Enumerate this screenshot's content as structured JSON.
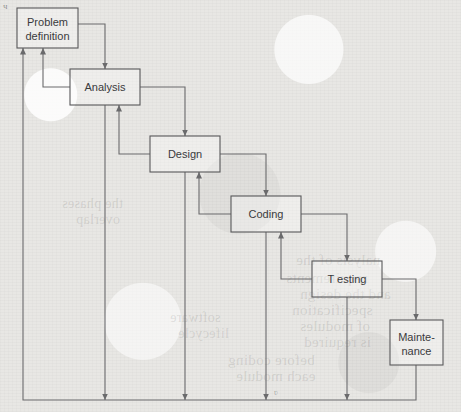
{
  "diagram": {
    "type": "flowchart",
    "canvas": {
      "width": 461,
      "height": 412
    },
    "colors": {
      "page_background": "#e8e7e4",
      "box_stroke": "#58585a",
      "box_fill": "rgba(255,255,255,0.30)",
      "connector_stroke": "#6a6a6c",
      "text": "#3a3a3c"
    },
    "corner_mark": "ч",
    "stray_mark": "ʋ",
    "nodes": [
      {
        "id": "problem",
        "label_line1": "Problem",
        "label_line2": "definition",
        "x": 17,
        "y": 8,
        "w": 61,
        "h": 40
      },
      {
        "id": "analysis",
        "label_line1": "Analysis",
        "label_line2": "",
        "x": 70,
        "y": 69,
        "w": 70,
        "h": 36
      },
      {
        "id": "design",
        "label_line1": "Design",
        "label_line2": "",
        "x": 150,
        "y": 136,
        "w": 70,
        "h": 36
      },
      {
        "id": "coding",
        "label_line1": "Coding",
        "label_line2": "",
        "x": 231,
        "y": 196,
        "w": 70,
        "h": 36
      },
      {
        "id": "testing",
        "label_line1": "T esting",
        "label_line2": "",
        "x": 312,
        "y": 261,
        "w": 70,
        "h": 36
      },
      {
        "id": "maintenance",
        "label_line1": "Mainte-",
        "label_line2": "nance",
        "x": 390,
        "y": 320,
        "w": 53,
        "h": 45
      }
    ],
    "edges": [
      {
        "id": "fwd-problem-analysis",
        "from": "problem",
        "to": "analysis",
        "kind": "forward",
        "path": "M78,24 H105 V69"
      },
      {
        "id": "fwd-analysis-design",
        "from": "analysis",
        "to": "design",
        "kind": "forward",
        "path": "M140,87 H185 V136"
      },
      {
        "id": "fwd-design-coding",
        "from": "design",
        "to": "coding",
        "kind": "forward",
        "path": "M220,154 H266 V196"
      },
      {
        "id": "fwd-coding-testing",
        "from": "coding",
        "to": "testing",
        "kind": "forward",
        "path": "M301,214 H347 V261"
      },
      {
        "id": "fwd-testing-maintenance",
        "from": "testing",
        "to": "maintenance",
        "kind": "forward",
        "path": "M382,279 H416 V320"
      },
      {
        "id": "back-analysis-problem",
        "from": "analysis",
        "to": "problem",
        "kind": "feedback",
        "path": "M70,87 H43 V48"
      },
      {
        "id": "back-design-analysis",
        "from": "design",
        "to": "analysis",
        "kind": "feedback",
        "path": "M150,154 H119 V105"
      },
      {
        "id": "back-coding-design",
        "from": "coding",
        "to": "design",
        "kind": "feedback",
        "path": "M231,214 H199 V172"
      },
      {
        "id": "back-testing-coding",
        "from": "testing",
        "to": "coding",
        "kind": "feedback",
        "path": "M312,279 H281 V232"
      },
      {
        "id": "drop-analysis-rail",
        "from": "analysis",
        "to": "rail",
        "kind": "drop",
        "path": "M105,105 V400"
      },
      {
        "id": "drop-design-rail",
        "from": "design",
        "to": "rail",
        "kind": "drop",
        "path": "M185,172 V400"
      },
      {
        "id": "drop-coding-rail",
        "from": "coding",
        "to": "rail",
        "kind": "drop",
        "path": "M266,232 V400"
      },
      {
        "id": "drop-testing-rail",
        "from": "testing",
        "to": "rail",
        "kind": "drop",
        "path": "M347,297 V400"
      },
      {
        "id": "rail-maintenance-problem",
        "from": "maintenance",
        "to": "problem",
        "kind": "return",
        "path": "M416,365 V400 H23 V48"
      }
    ],
    "ghost_text": [
      {
        "text": "nalysis of the",
        "x": 296,
        "y": 252,
        "size": 15
      },
      {
        "text": "requirements",
        "x": 286,
        "y": 270,
        "size": 15
      },
      {
        "text": "and the design",
        "x": 300,
        "y": 286,
        "size": 15
      },
      {
        "text": "specification",
        "x": 292,
        "y": 302,
        "size": 15
      },
      {
        "text": "of modules",
        "x": 300,
        "y": 318,
        "size": 15
      },
      {
        "text": "is required",
        "x": 304,
        "y": 334,
        "size": 15
      },
      {
        "text": "before coding",
        "x": 228,
        "y": 352,
        "size": 15
      },
      {
        "text": "each module",
        "x": 236,
        "y": 368,
        "size": 15
      },
      {
        "text": "the phases",
        "x": 62,
        "y": 196,
        "size": 14
      },
      {
        "text": "overlap",
        "x": 76,
        "y": 212,
        "size": 14
      },
      {
        "text": "software",
        "x": 170,
        "y": 310,
        "size": 14
      },
      {
        "text": "lifecycle",
        "x": 178,
        "y": 326,
        "size": 14
      }
    ]
  }
}
